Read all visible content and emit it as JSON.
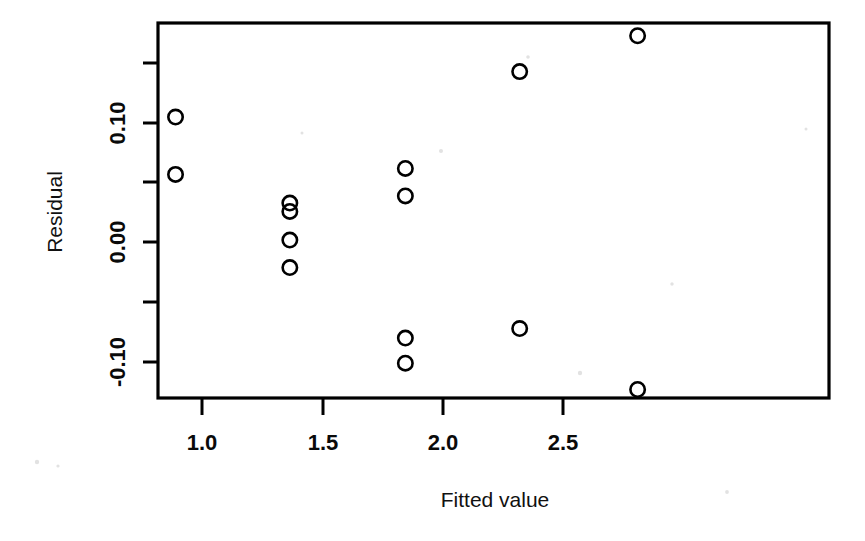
{
  "figure": {
    "background_color": "#ffffff",
    "foreground_color": "#000000",
    "width": 865,
    "height": 541
  },
  "axes": {
    "x_title": "Fitted value",
    "y_title": "Residual",
    "x_tick_labels": [
      "1.0",
      "1.5",
      "2.0",
      "2.5"
    ],
    "y_tick_labels": [
      "0.10",
      "0.00",
      "-0.10"
    ]
  },
  "chart_data": {
    "type": "scatter",
    "title": "",
    "xlabel": "Fitted value",
    "ylabel": "Residual",
    "xlim": [
      0.82,
      2.88
    ],
    "ylim": [
      -0.145,
      0.183
    ],
    "grid": false,
    "legend": null,
    "marker": "open-circle",
    "marker_color": "#000000",
    "x_ticks": [
      1.0,
      1.5,
      2.0,
      2.5
    ],
    "x_tick_labels": [
      "1.0",
      "1.5",
      "2.0",
      "2.5"
    ],
    "y_ticks": [
      0.15,
      0.1,
      0.05,
      0.0,
      -0.05,
      -0.1
    ],
    "y_tick_labels": [
      "",
      "0.10",
      "",
      "0.00",
      "",
      "-0.10"
    ],
    "y_labeled_ticks": [
      0.1,
      0.0,
      -0.1
    ],
    "points": [
      {
        "x": 0.89,
        "y": 0.105
      },
      {
        "x": 0.89,
        "y": 0.057
      },
      {
        "x": 1.365,
        "y": 0.033
      },
      {
        "x": 1.365,
        "y": 0.026
      },
      {
        "x": 1.365,
        "y": 0.002
      },
      {
        "x": 1.365,
        "y": -0.021
      },
      {
        "x": 1.845,
        "y": 0.062
      },
      {
        "x": 1.845,
        "y": 0.039
      },
      {
        "x": 1.845,
        "y": -0.08
      },
      {
        "x": 1.845,
        "y": -0.101
      },
      {
        "x": 2.32,
        "y": 0.143
      },
      {
        "x": 2.32,
        "y": -0.072
      },
      {
        "x": 2.81,
        "y": 0.173
      },
      {
        "x": 2.81,
        "y": -0.123
      }
    ]
  }
}
